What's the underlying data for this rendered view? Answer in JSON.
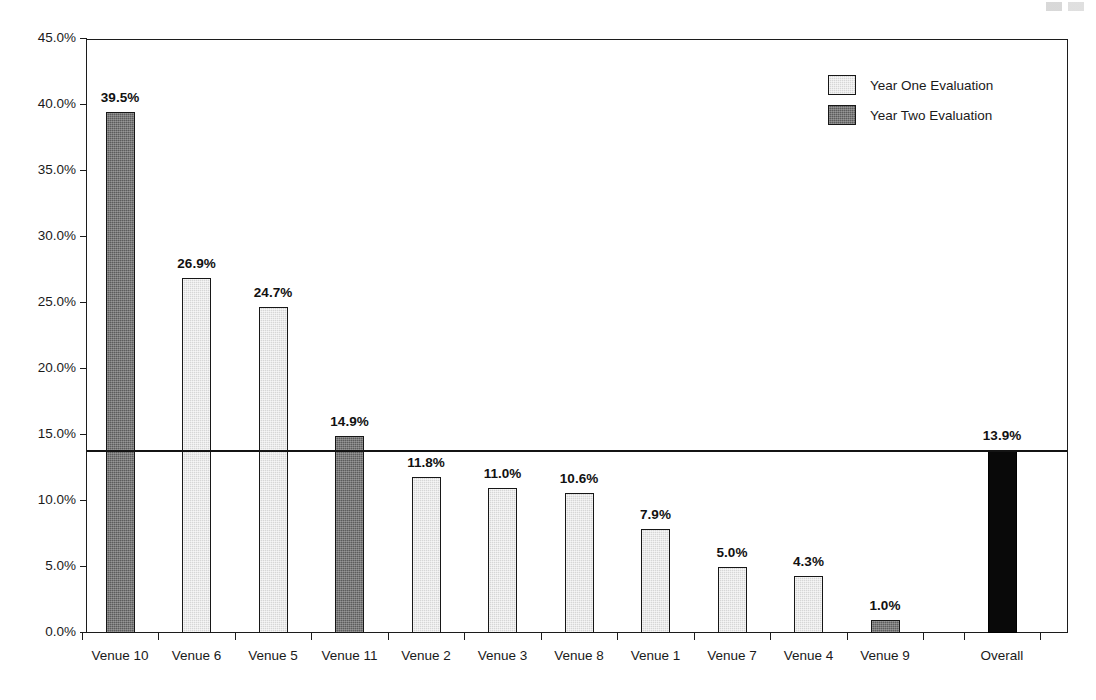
{
  "chart_data": {
    "type": "bar",
    "title": "",
    "subtitle": "",
    "xlabel": "",
    "ylabel": "",
    "ylim": [
      0,
      45
    ],
    "grid": false,
    "legend_position": "top-right",
    "y_ticks": [
      "0.0%",
      "5.0%",
      "10.0%",
      "15.0%",
      "20.0%",
      "25.0%",
      "30.0%",
      "35.0%",
      "40.0%",
      "45.0%"
    ],
    "y_tick_values": [
      0,
      5,
      10,
      15,
      20,
      25,
      30,
      35,
      40,
      45
    ],
    "categories": [
      "Venue 10",
      "Venue 6",
      "Venue 5",
      "Venue 11",
      "Venue 2",
      "Venue 3",
      "Venue 8",
      "Venue 1",
      "Venue 7",
      "Venue 4",
      "Venue 9",
      "Overall"
    ],
    "values": [
      39.5,
      26.9,
      24.7,
      14.9,
      11.8,
      11.0,
      10.6,
      7.9,
      5.0,
      4.3,
      1.0,
      13.9
    ],
    "value_labels": [
      "39.5%",
      "26.9%",
      "24.7%",
      "14.9%",
      "11.8%",
      "11.0%",
      "10.6%",
      "7.9%",
      "5.0%",
      "4.3%",
      "1.0%",
      "13.9%"
    ],
    "series_of_bar": [
      "Year Two Evaluation",
      "Year One Evaluation",
      "Year One Evaluation",
      "Year Two Evaluation",
      "Year One Evaluation",
      "Year One Evaluation",
      "Year One Evaluation",
      "Year One Evaluation",
      "Year One Evaluation",
      "Year One Evaluation",
      "Year Two Evaluation",
      "Overall"
    ],
    "annotations": [
      {
        "type": "reference-line",
        "value": 13.9,
        "label": "13.9%",
        "orientation": "horizontal"
      }
    ],
    "legend": [
      {
        "label": "Year One Evaluation",
        "color": "#d6d6d6",
        "key": "year-one"
      },
      {
        "label": "Year Two Evaluation",
        "color": "#5c5c5c",
        "key": "year-two"
      }
    ],
    "colors": {
      "year_one": "#d6d6d6",
      "year_two": "#5c5c5c",
      "overall": "#090909",
      "axis": "#1c1c1c",
      "text": "#1a1a1a",
      "reference_line": "#141414",
      "background": "#ffffff"
    }
  }
}
